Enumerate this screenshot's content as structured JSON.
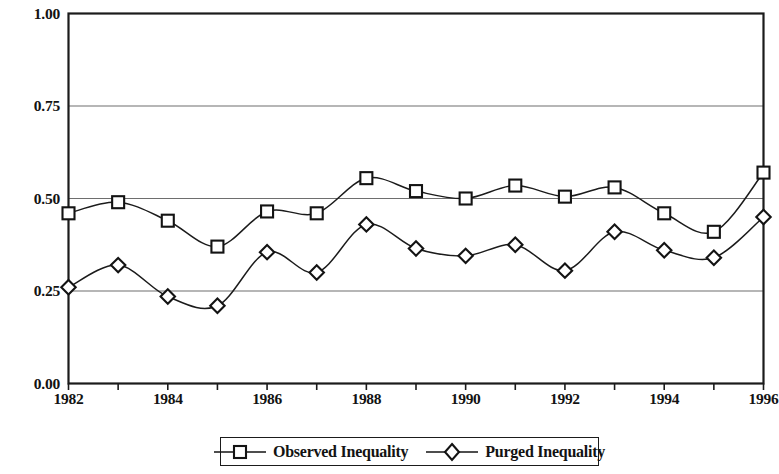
{
  "chart_data": {
    "type": "line",
    "title": "",
    "subtitle": "",
    "xlabel": "",
    "ylabel": "",
    "x": [
      1982,
      1983,
      1984,
      1985,
      1986,
      1987,
      1988,
      1989,
      1990,
      1991,
      1992,
      1993,
      1994,
      1995,
      1996
    ],
    "xlim": [
      1982,
      1996
    ],
    "ylim": [
      0.0,
      1.0
    ],
    "yticks": [
      0.0,
      0.25,
      0.5,
      0.75,
      1.0
    ],
    "ytick_labels": [
      "0.00",
      "0.25",
      "0.50",
      "0.75",
      "1.00"
    ],
    "xticks": [
      1982,
      1983,
      1984,
      1985,
      1986,
      1987,
      1988,
      1989,
      1990,
      1991,
      1992,
      1993,
      1994,
      1995,
      1996
    ],
    "xtick_labels_shown": [
      "1982",
      "1984",
      "1986",
      "1988",
      "1990",
      "1992",
      "1994",
      "1996"
    ],
    "grid": "horizontal",
    "legend_position": "bottom",
    "series": [
      {
        "name": "Observed Inequality",
        "marker": "square",
        "color": "#1b1b1b",
        "values": [
          0.46,
          0.49,
          0.44,
          0.37,
          0.465,
          0.46,
          0.555,
          0.52,
          0.5,
          0.535,
          0.505,
          0.53,
          0.46,
          0.41,
          0.57
        ]
      },
      {
        "name": "Purged Inequality",
        "marker": "diamond",
        "color": "#1b1b1b",
        "values": [
          0.26,
          0.32,
          0.235,
          0.21,
          0.355,
          0.3,
          0.43,
          0.365,
          0.345,
          0.375,
          0.305,
          0.41,
          0.36,
          0.34,
          0.45
        ]
      }
    ]
  },
  "axes": {
    "y_labels": [
      "1.00",
      "0.75",
      "0.50",
      "0.25",
      "0.00"
    ],
    "x_labels": [
      "1982",
      "1984",
      "1986",
      "1988",
      "1990",
      "1992",
      "1994",
      "1996"
    ]
  },
  "legend": {
    "items": [
      {
        "label": "Observed Inequality",
        "marker": "square-marker-icon"
      },
      {
        "label": "Purged Inequality",
        "marker": "diamond-marker-icon"
      }
    ]
  }
}
